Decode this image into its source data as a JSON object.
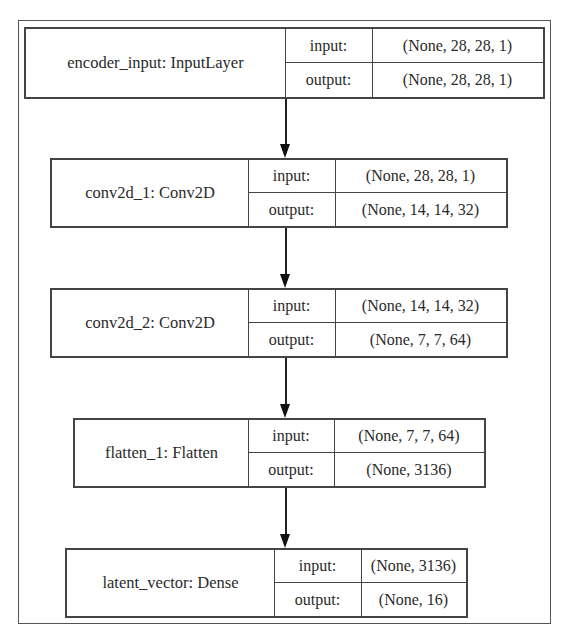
{
  "diagram": {
    "type": "keras-model-plot",
    "layers": [
      {
        "name": "encoder_input: InputLayer",
        "input_label": "input:",
        "input_shape": "(None, 28, 28, 1)",
        "output_label": "output:",
        "output_shape": "(None, 28, 28, 1)"
      },
      {
        "name": "conv2d_1: Conv2D",
        "input_label": "input:",
        "input_shape": "(None, 28, 28, 1)",
        "output_label": "output:",
        "output_shape": "(None, 14, 14, 32)"
      },
      {
        "name": "conv2d_2: Conv2D",
        "input_label": "input:",
        "input_shape": "(None, 14, 14, 32)",
        "output_label": "output:",
        "output_shape": "(None, 7, 7, 64)"
      },
      {
        "name": "flatten_1: Flatten",
        "input_label": "input:",
        "input_shape": "(None, 7, 7, 64)",
        "output_label": "output:",
        "output_shape": "(None, 3136)"
      },
      {
        "name": "latent_vector: Dense",
        "input_label": "input:",
        "input_shape": "(None, 3136)",
        "output_label": "output:",
        "output_shape": "(None, 16)"
      }
    ],
    "edges": [
      {
        "from": "encoder_input",
        "to": "conv2d_1"
      },
      {
        "from": "conv2d_1",
        "to": "conv2d_2"
      },
      {
        "from": "conv2d_2",
        "to": "flatten_1"
      },
      {
        "from": "flatten_1",
        "to": "latent_vector"
      }
    ]
  }
}
